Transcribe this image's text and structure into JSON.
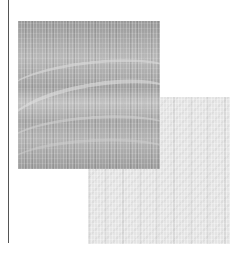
{
  "figure": {
    "colors": {
      "background": "#ffffff",
      "rule": "#555555",
      "dark_panel": "#a8a8a8",
      "light_panel": "#e4e4e4"
    },
    "panels": [
      {
        "name": "dark-textured-panel",
        "x": 18,
        "y": 21,
        "width": 142,
        "height": 148
      },
      {
        "name": "light-textured-panel",
        "x": 88,
        "y": 97,
        "width": 142,
        "height": 147
      }
    ]
  }
}
